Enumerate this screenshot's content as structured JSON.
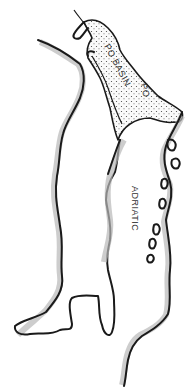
{
  "map": {
    "labels": {
      "po_basin": "PO BASIN",
      "po_river": "PO",
      "adriatic": "ADRIATIC"
    },
    "colors": {
      "ink": "#1a1a1a",
      "hatching": "#b8b8b8",
      "background": "#ffffff"
    }
  }
}
